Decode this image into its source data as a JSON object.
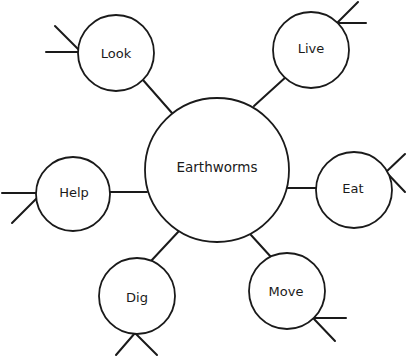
{
  "diagram": {
    "type": "concept-web",
    "stroke_color": "#1a1a1a",
    "background": "#ffffff",
    "center": {
      "label": "Earthworms",
      "cx": 217,
      "cy": 170,
      "r": 72
    },
    "nodes": [
      {
        "id": "look",
        "label": "Look",
        "cx": 116,
        "cy": 53,
        "r": 38
      },
      {
        "id": "live",
        "label": "Live",
        "cx": 311,
        "cy": 50,
        "r": 38
      },
      {
        "id": "help",
        "label": "Help",
        "cx": 73,
        "cy": 194,
        "r": 37
      },
      {
        "id": "eat",
        "label": "Eat",
        "cx": 354,
        "cy": 190,
        "r": 38
      },
      {
        "id": "dig",
        "label": "Dig",
        "cx": 137,
        "cy": 296,
        "r": 38
      },
      {
        "id": "move",
        "label": "Move",
        "cx": 287,
        "cy": 291,
        "r": 38
      }
    ]
  }
}
